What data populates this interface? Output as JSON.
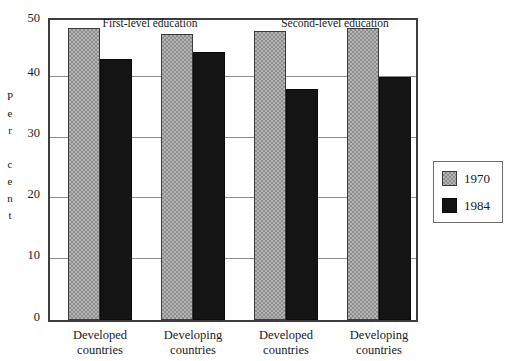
{
  "chart_data": {
    "type": "bar",
    "title": "",
    "xlabel": "",
    "ylabel": "Per cent",
    "ylim": [
      0,
      50
    ],
    "yticks": [
      0,
      10,
      20,
      30,
      40,
      50
    ],
    "ytick_labels": [
      "0",
      "10",
      "20",
      "30",
      "40",
      "50"
    ],
    "grid": true,
    "legend_position": "right",
    "categories": [
      "Developed countries",
      "Developing countries",
      "Developed countries",
      "Developing countries"
    ],
    "category_lines": [
      [
        "Developed",
        "countries"
      ],
      [
        "Developing",
        "countries"
      ],
      [
        "Developed",
        "countries"
      ],
      [
        "Developing",
        "countries"
      ]
    ],
    "group_titles": [
      "First-level education",
      "Second-level education"
    ],
    "series": [
      {
        "name": "1970",
        "color": "#b4b4b4",
        "values": [
          48,
          47,
          47.5,
          48
        ]
      },
      {
        "name": "1984",
        "color": "#141414",
        "values": [
          43,
          44,
          38,
          40
        ]
      }
    ],
    "legend": [
      {
        "label": "1970",
        "swatch": "hatched-gray"
      },
      {
        "label": "1984",
        "swatch": "solid-black"
      }
    ]
  },
  "axis": {
    "y_title_letters": [
      "P",
      "e",
      "r",
      "",
      "c",
      "e",
      "n",
      "t"
    ]
  }
}
